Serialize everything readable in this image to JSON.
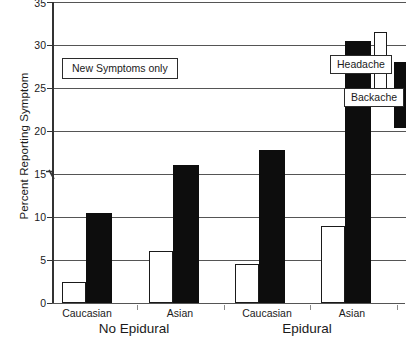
{
  "chart_data": {
    "type": "bar",
    "title": "",
    "subtitle": "",
    "xlabel": "",
    "ylabel": "Percent Reporting Symptom",
    "ylim": [
      0,
      35
    ],
    "ytick_step": 5,
    "yticks": [
      "0",
      "5",
      "10",
      "15",
      "20",
      "25",
      "30",
      "35"
    ],
    "grid": "horizontal",
    "axis_break": {
      "present": true,
      "at": 15,
      "axis": "y"
    },
    "categories": [
      "Caucasian",
      "Asian",
      "Caucasian",
      "Asian"
    ],
    "group_labels": [
      "No Epidural",
      "Epidural"
    ],
    "series": [
      {
        "name": "Headache",
        "fill": "#ffffff",
        "stroke": "#1a1a1a",
        "values": [
          2.5,
          6.0,
          4.5,
          8.9
        ]
      },
      {
        "name": "Backache",
        "fill": "#0d0d0d",
        "stroke": "#0d0d0d",
        "values": [
          10.5,
          16.1,
          17.8,
          30.5
        ]
      }
    ],
    "annotations": [
      {
        "text": "New Symptoms only",
        "boxed": true
      }
    ],
    "legend": {
      "position": "inside-top-right",
      "entries": [
        {
          "label": "Headache",
          "swatch": "white-bar"
        },
        {
          "label": "Backache",
          "swatch": "black-bar"
        }
      ]
    }
  },
  "ytick_labels": {
    "t0": "0",
    "t1": "5",
    "t2": "10",
    "t3": "15",
    "t4": "20",
    "t5": "25",
    "t6": "30",
    "t7": "35"
  },
  "xtick_labels": {
    "g0": "Caucasian",
    "g1": "Asian",
    "g2": "Caucasian",
    "g3": "Asian"
  },
  "xgroup_labels": {
    "left": "No Epidural",
    "right": "Epidural"
  },
  "annotation": {
    "new_symptoms": "New Symptoms only"
  },
  "legend": {
    "headache": "Headache",
    "backache": "Backache"
  },
  "axis": {
    "ylabel": "Percent Reporting Symptom"
  },
  "colors": {
    "headache_fill": "#ffffff",
    "backache_fill": "#0d0d0d",
    "grid": "#555555",
    "axis": "#333333",
    "text": "#1a1a1a"
  }
}
